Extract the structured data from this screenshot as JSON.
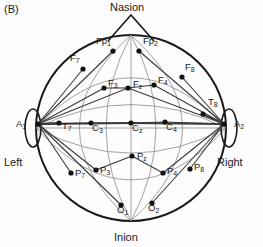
{
  "figure": {
    "panel_label": "(B)",
    "title_anatomy": {
      "nasion": "Nasion",
      "inion": "Inion"
    },
    "sides": {
      "left": "Left",
      "right": "Right"
    },
    "colors": {
      "head_outline": "#1a1a1a",
      "electrode": "#111111",
      "measure_line": "#3a3a3a",
      "grid_line": "#8a8a8a",
      "text": "#1a1a1a",
      "background": "#fdfdfd"
    }
  },
  "chart_data": {
    "type": "scatter",
    "xlabel": "",
    "ylabel": "",
    "xlim": [
      0,
      263
    ],
    "ylim": [
      0,
      247
    ],
    "grid": false,
    "legend": "none",
    "annotations": [
      "(B)",
      "Nasion",
      "Inion",
      "Left",
      "Right"
    ],
    "head_center": [
      131,
      128
    ],
    "head_rx": 95,
    "head_ry": 93,
    "electrodes": [
      {
        "name": "Fp1",
        "base": "Fp",
        "sub": "1",
        "x": 113,
        "y": 51,
        "label_dx": -17,
        "label_dy": -10
      },
      {
        "name": "Fp2",
        "base": "Fp",
        "sub": "2",
        "x": 139,
        "y": 51,
        "label_dx": 4,
        "label_dy": -10
      },
      {
        "name": "F7",
        "base": "F",
        "sub": "7",
        "x": 83,
        "y": 69,
        "label_dx": -13,
        "label_dy": -11
      },
      {
        "name": "F8",
        "base": "F",
        "sub": "8",
        "x": 182,
        "y": 77,
        "label_dx": 3,
        "label_dy": -10
      },
      {
        "name": "F3",
        "base": "F",
        "sub": "3",
        "x": 104,
        "y": 88,
        "label_dx": 4,
        "label_dy": -5
      },
      {
        "name": "Fz",
        "base": "F",
        "sub": "z",
        "x": 128,
        "y": 88,
        "label_dx": 5,
        "label_dy": -4
      },
      {
        "name": "F4",
        "base": "F",
        "sub": "4",
        "x": 154,
        "y": 85,
        "label_dx": 4,
        "label_dy": -5
      },
      {
        "name": "T7",
        "base": "T",
        "sub": "7",
        "x": 59,
        "y": 123,
        "label_dx": 3,
        "label_dy": 3
      },
      {
        "name": "T8",
        "base": "T",
        "sub": "8",
        "x": 203,
        "y": 114,
        "label_dx": 5,
        "label_dy": -12
      },
      {
        "name": "C3",
        "base": "C",
        "sub": "3",
        "x": 91,
        "y": 123,
        "label_dx": 1,
        "label_dy": 5
      },
      {
        "name": "Cz",
        "base": "C",
        "sub": "z",
        "x": 131,
        "y": 123,
        "label_dx": 1,
        "label_dy": 5
      },
      {
        "name": "C4",
        "base": "C",
        "sub": "4",
        "x": 165,
        "y": 122,
        "label_dx": 1,
        "label_dy": 5
      },
      {
        "name": "P3",
        "base": "P",
        "sub": "3",
        "x": 96,
        "y": 170,
        "label_dx": 4,
        "label_dy": 0
      },
      {
        "name": "Pz",
        "base": "P",
        "sub": "z",
        "x": 132,
        "y": 156,
        "label_dx": 5,
        "label_dy": 0
      },
      {
        "name": "P4",
        "base": "P",
        "sub": "4",
        "x": 163,
        "y": 173,
        "label_dx": 4,
        "label_dy": -2
      },
      {
        "name": "P7",
        "base": "P",
        "sub": "7",
        "x": 71,
        "y": 173,
        "label_dx": 4,
        "label_dy": 0
      },
      {
        "name": "P8",
        "base": "P",
        "sub": "8",
        "x": 190,
        "y": 169,
        "label_dx": 4,
        "label_dy": -2
      },
      {
        "name": "O1",
        "base": "O",
        "sub": "1",
        "x": 121,
        "y": 205,
        "label_dx": -4,
        "label_dy": 5
      },
      {
        "name": "O2",
        "base": "O",
        "sub": "2",
        "x": 152,
        "y": 203,
        "label_dx": -4,
        "label_dy": 5
      }
    ],
    "reference_electrodes": [
      {
        "name": "A1",
        "base": "A",
        "sub": "1",
        "x": 38,
        "y": 124,
        "label_dx": -22,
        "label_dy": 0
      },
      {
        "name": "A2",
        "base": "A",
        "sub": "2",
        "x": 224,
        "y": 124,
        "label_dx": 10,
        "label_dy": 0
      }
    ],
    "measurement_lines_from_A1": [
      "Fp1",
      "F7",
      "F3",
      "Fz",
      "T7",
      "C3",
      "Cz",
      "P7",
      "P3",
      "O1"
    ],
    "measurement_lines_from_A2": [
      "Fp2",
      "F8",
      "F4",
      "Fz",
      "T8",
      "C4",
      "Cz",
      "P8",
      "P4",
      "O2"
    ]
  }
}
